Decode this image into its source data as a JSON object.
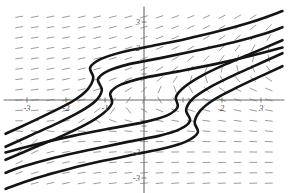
{
  "figure": {
    "title": "",
    "background_color": "#ffffff",
    "width": 299,
    "height": 193
  },
  "chart_data": {
    "type": "line",
    "title": "",
    "xlabel": "",
    "ylabel": "",
    "xlim": [
      -3.6,
      3.6
    ],
    "ylim": [
      -3.6,
      3.6
    ],
    "grid": false,
    "legend": "none",
    "axes": {
      "origin_px": [
        144,
        100
      ],
      "x_scale_px_per_unit": 39,
      "y_scale_px_per_unit": 26,
      "x_axis_color": "#6b6b6b",
      "y_axis_color": "#6b6b6b"
    },
    "xticks": [
      -3,
      -2,
      -1,
      1,
      2,
      3
    ],
    "xtick_labels": [
      "-3",
      "-2",
      "-1",
      "",
      "2",
      "3"
    ],
    "yticks": [
      -3,
      -2,
      -1,
      1,
      2,
      3
    ],
    "ytick_labels": [
      "-3",
      "-2",
      "",
      "",
      "2",
      "3"
    ],
    "slope_field": {
      "color": "#8a8a8a",
      "segment_length": 7,
      "x_samples": [
        -3.2,
        -2.8,
        -2.4,
        -2.0,
        -1.6,
        -1.2,
        -0.8,
        -0.4,
        0.0,
        0.4,
        0.8,
        1.2,
        1.6,
        2.0,
        2.4,
        2.8,
        3.2
      ],
      "y_samples": [
        3.2,
        2.8,
        2.4,
        2.0,
        1.6,
        1.2,
        0.8,
        0.4,
        0.0,
        -0.4,
        -0.8,
        -1.2,
        -1.6,
        -2.0,
        -2.4,
        -2.8,
        -3.2
      ],
      "note": "slopes near-vertical at far left, flattening toward the right"
    },
    "series": [
      {
        "name": "curve-1-upper",
        "color": "#141414",
        "points": [
          [
            -3.55,
            -1.3
          ],
          [
            -2.9,
            -0.85
          ],
          [
            -2.3,
            -0.42
          ],
          [
            -1.8,
            -0.02
          ],
          [
            -1.45,
            0.4
          ],
          [
            -1.3,
            0.85
          ],
          [
            -1.38,
            1.25
          ],
          [
            -1.1,
            1.58
          ],
          [
            -0.55,
            1.85
          ],
          [
            0.2,
            2.08
          ],
          [
            1.05,
            2.34
          ],
          [
            1.95,
            2.66
          ],
          [
            2.8,
            3.02
          ],
          [
            3.55,
            3.42
          ]
        ]
      },
      {
        "name": "curve-2-upper",
        "color": "#141414",
        "points": [
          [
            -3.55,
            -1.8
          ],
          [
            -2.85,
            -1.32
          ],
          [
            -2.2,
            -0.88
          ],
          [
            -1.65,
            -0.46
          ],
          [
            -1.25,
            -0.05
          ],
          [
            -1.08,
            0.38
          ],
          [
            -1.18,
            0.8
          ],
          [
            -0.92,
            1.12
          ],
          [
            -0.38,
            1.38
          ],
          [
            0.45,
            1.62
          ],
          [
            1.35,
            1.9
          ],
          [
            2.3,
            2.22
          ],
          [
            3.15,
            2.58
          ],
          [
            3.55,
            2.8
          ]
        ]
      },
      {
        "name": "curve-3-upper",
        "color": "#141414",
        "points": [
          [
            -3.55,
            -2.3
          ],
          [
            -2.8,
            -1.82
          ],
          [
            -2.1,
            -1.38
          ],
          [
            -1.5,
            -0.95
          ],
          [
            -1.05,
            -0.52
          ],
          [
            -0.82,
            -0.12
          ],
          [
            -0.86,
            0.28
          ],
          [
            -0.58,
            0.6
          ],
          [
            0.02,
            0.86
          ],
          [
            0.88,
            1.1
          ],
          [
            1.82,
            1.38
          ],
          [
            2.75,
            1.7
          ],
          [
            3.55,
            2.02
          ]
        ]
      },
      {
        "name": "curve-1-lower",
        "color": "#141414",
        "points": [
          [
            3.55,
            1.3
          ],
          [
            2.9,
            0.85
          ],
          [
            2.3,
            0.42
          ],
          [
            1.8,
            0.02
          ],
          [
            1.45,
            -0.4
          ],
          [
            1.3,
            -0.85
          ],
          [
            1.38,
            -1.25
          ],
          [
            1.1,
            -1.58
          ],
          [
            0.55,
            -1.85
          ],
          [
            -0.2,
            -2.08
          ],
          [
            -1.05,
            -2.34
          ],
          [
            -1.95,
            -2.66
          ],
          [
            -2.8,
            -3.02
          ],
          [
            -3.55,
            -3.42
          ]
        ]
      },
      {
        "name": "curve-2-lower",
        "color": "#141414",
        "points": [
          [
            3.55,
            1.8
          ],
          [
            2.85,
            1.32
          ],
          [
            2.2,
            0.88
          ],
          [
            1.65,
            0.46
          ],
          [
            1.25,
            0.05
          ],
          [
            1.08,
            -0.38
          ],
          [
            1.18,
            -0.8
          ],
          [
            0.92,
            -1.12
          ],
          [
            0.38,
            -1.38
          ],
          [
            -0.45,
            -1.62
          ],
          [
            -1.35,
            -1.9
          ],
          [
            -2.3,
            -2.22
          ],
          [
            -3.15,
            -2.58
          ],
          [
            -3.55,
            -2.8
          ]
        ]
      },
      {
        "name": "curve-3-lower",
        "color": "#141414",
        "points": [
          [
            3.55,
            2.3
          ],
          [
            2.8,
            1.82
          ],
          [
            2.1,
            1.38
          ],
          [
            1.5,
            0.95
          ],
          [
            1.05,
            0.52
          ],
          [
            0.82,
            0.12
          ],
          [
            0.86,
            -0.28
          ],
          [
            0.58,
            -0.6
          ],
          [
            -0.02,
            -0.86
          ],
          [
            -0.88,
            -1.1
          ],
          [
            -1.82,
            -1.38
          ],
          [
            -2.75,
            -1.7
          ],
          [
            -3.55,
            -2.02
          ]
        ]
      }
    ]
  }
}
